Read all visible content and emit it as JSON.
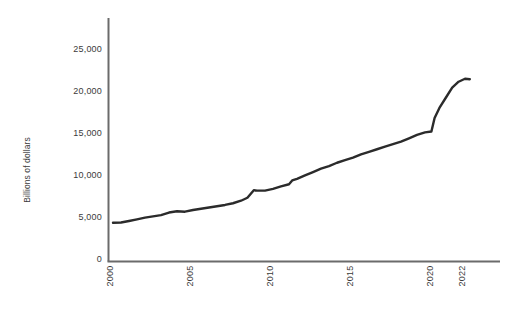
{
  "chart_data": {
    "type": "line",
    "title": "",
    "subtitle": "",
    "xlabel": "",
    "ylabel": "Billions of dollars",
    "xlim": [
      2000,
      2022.5
    ],
    "ylim": [
      0,
      27000
    ],
    "grid": false,
    "legend": false,
    "x_ticks": [
      "2000",
      "2005",
      "2010",
      "2015",
      "2020",
      "2022"
    ],
    "x_tick_values": [
      2000,
      2005,
      2010,
      2015,
      2020,
      2022
    ],
    "y_ticks": [
      "0",
      "5,000",
      "10,000",
      "15,000",
      "20,000",
      "25,000"
    ],
    "y_tick_values": [
      0,
      5000,
      10000,
      15000,
      20000,
      25000
    ],
    "line_color": "#2b2b2b",
    "axis_color": "#6b6b6b",
    "series": [
      {
        "name": "Billions of dollars",
        "x": [
          2000,
          2000.5,
          2001,
          2001.5,
          2002,
          2002.5,
          2003,
          2003.5,
          2004,
          2004.5,
          2005,
          2005.5,
          2006,
          2006.5,
          2007,
          2007.5,
          2008,
          2008.4,
          2008.8,
          2009,
          2009.5,
          2010,
          2010.5,
          2011,
          2011.2,
          2011.5,
          2012,
          2012.5,
          2013,
          2013.5,
          2014,
          2014.5,
          2015,
          2015.5,
          2016,
          2016.5,
          2017,
          2017.5,
          2018,
          2018.5,
          2019,
          2019.5,
          2019.9,
          2020.1,
          2020.4,
          2020.8,
          2021.2,
          2021.6,
          2022,
          2022.3
        ],
        "values": [
          4600,
          4620,
          4800,
          5000,
          5200,
          5350,
          5500,
          5800,
          5950,
          5900,
          6100,
          6250,
          6400,
          6550,
          6700,
          6900,
          7200,
          7550,
          8450,
          8400,
          8400,
          8600,
          8900,
          9150,
          9600,
          9800,
          10200,
          10600,
          11000,
          11300,
          11700,
          12000,
          12300,
          12700,
          13000,
          13300,
          13600,
          13900,
          14200,
          14600,
          15000,
          15300,
          15400,
          17000,
          18200,
          19400,
          20600,
          21300,
          21650,
          21600
        ]
      }
    ]
  }
}
